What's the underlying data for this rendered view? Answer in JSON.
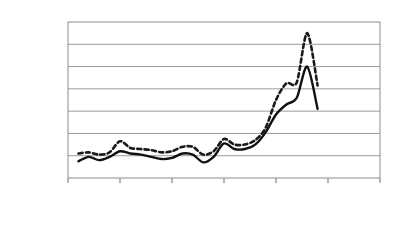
{
  "chart_data": {
    "type": "line",
    "title": "",
    "subtitle": "",
    "xlabel": "",
    "ylabel": "每桶/美元",
    "xlim": [
      1985,
      2015
    ],
    "ylim": [
      0,
      140
    ],
    "grid": true,
    "grid_axis": "y",
    "legend_position": "inline-right",
    "y_ticks": [
      0,
      20,
      40,
      60,
      80,
      100,
      120,
      140
    ],
    "y_tick_labels": [
      "0",
      "20",
      "40",
      "60",
      "80",
      "100",
      "120",
      "140"
    ],
    "x_ticks": [
      1985,
      1990,
      1995,
      2000,
      2005,
      2010,
      2015
    ],
    "x_tick_labels": [
      "1985",
      "1990",
      "1995",
      "2000",
      "2005",
      "2010",
      "2015"
    ],
    "x": [
      1986,
      1987,
      1988,
      1989,
      1990,
      1991,
      1992,
      1993,
      1994,
      1995,
      1996,
      1997,
      1998,
      1999,
      2000,
      2001,
      2002,
      2003,
      2004,
      2005,
      2006,
      2007,
      2008,
      2009
    ],
    "series": [
      {
        "name": "航空用油",
        "style": "dashed",
        "color": "#1a1a1a",
        "values": [
          22,
          23,
          21,
          23,
          33,
          27,
          26,
          25,
          23,
          24,
          28,
          28,
          21,
          24,
          35,
          30,
          30,
          34,
          45,
          70,
          85,
          86,
          130,
          83
        ]
      },
      {
        "name": "西德州中級原油",
        "style": "solid",
        "color": "#111111",
        "values": [
          15,
          19,
          16,
          19,
          24,
          22,
          21,
          19,
          17,
          18,
          22,
          21,
          14,
          19,
          31,
          26,
          26,
          30,
          41,
          57,
          66,
          72,
          100,
          62
        ]
      }
    ],
    "annotations": [
      {
        "text": "航空用油",
        "x": 2010.4,
        "y": 80
      },
      {
        "text": "西德州中級原油",
        "x": 2009.0,
        "y": 52
      }
    ],
    "colors": {
      "axis": "#6e6e6e",
      "grid": "#9a9a9a",
      "text": "#2f2f2f",
      "background": "#ffffff",
      "jet_fuel": "#1a1a1a",
      "wti_crude": "#111111"
    }
  },
  "axis": {
    "y_label": "每桶/美元",
    "y_ticks": [
      "140",
      "120",
      "100",
      "80",
      "60",
      "40",
      "20",
      "0"
    ],
    "x_ticks": [
      "1985",
      "1990",
      "1995",
      "2000",
      "2005",
      "2010",
      "2015"
    ]
  },
  "legend": {
    "jet_fuel_label": "航空用油",
    "wti_label": "西德州中級原油"
  }
}
